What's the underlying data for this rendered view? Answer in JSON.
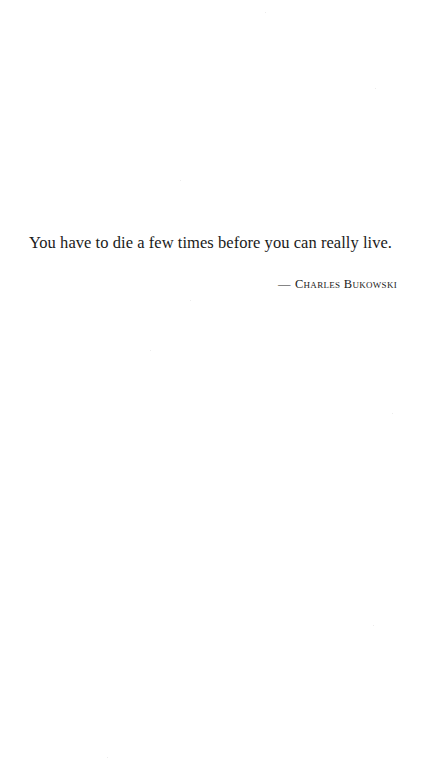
{
  "quote": {
    "text": "You have to die a few times before you can really live.",
    "dash": "—",
    "author": "Charles Bukowski"
  },
  "colors": {
    "background": "#ffffff",
    "text": "#1a1a1a"
  }
}
